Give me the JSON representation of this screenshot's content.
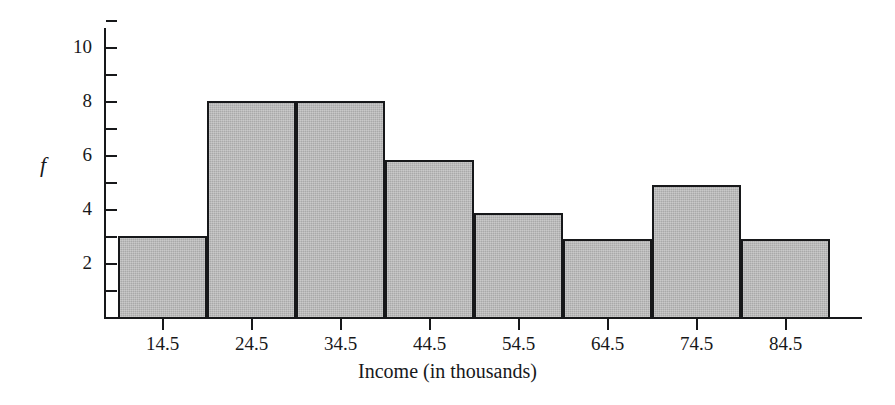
{
  "chart_data": {
    "type": "bar",
    "title": "",
    "subtitle": "",
    "xlabel": "Income (in thousands)",
    "ylabel": "f",
    "categories": [
      "14.5",
      "24.5",
      "34.5",
      "44.5",
      "54.5",
      "64.5",
      "74.5",
      "84.5"
    ],
    "values": [
      3,
      8,
      8,
      5.8,
      3.85,
      2.9,
      4.9,
      2.9
    ],
    "ylim": [
      0,
      11
    ],
    "y_tick_values": [
      1,
      2,
      3,
      4,
      5,
      6,
      7,
      8,
      9,
      10,
      11
    ],
    "y_tick_labels": [
      "",
      "2",
      "",
      "4",
      "",
      "6",
      "",
      "8",
      "",
      "10",
      ""
    ],
    "grid": false,
    "legend": null,
    "bar_fill_color": "#a9a9a9",
    "bar_edge_color": "#17181a",
    "axis_color": "#17181a",
    "background_color": "#ffffff"
  },
  "axes": {
    "y_label": "f",
    "x_label": "Income (in thousands)"
  },
  "ticks": {
    "y": [
      {
        "value": 11,
        "label": ""
      },
      {
        "value": 10,
        "label": "10"
      },
      {
        "value": 9,
        "label": ""
      },
      {
        "value": 8,
        "label": "8"
      },
      {
        "value": 7,
        "label": ""
      },
      {
        "value": 6,
        "label": "6"
      },
      {
        "value": 5,
        "label": ""
      },
      {
        "value": 4,
        "label": "4"
      },
      {
        "value": 3,
        "label": ""
      },
      {
        "value": 2,
        "label": "2"
      },
      {
        "value": 1,
        "label": ""
      }
    ],
    "x": [
      {
        "label": "14.5"
      },
      {
        "label": "24.5"
      },
      {
        "label": "34.5"
      },
      {
        "label": "44.5"
      },
      {
        "label": "54.5"
      },
      {
        "label": "64.5"
      },
      {
        "label": "74.5"
      },
      {
        "label": "84.5"
      }
    ]
  }
}
